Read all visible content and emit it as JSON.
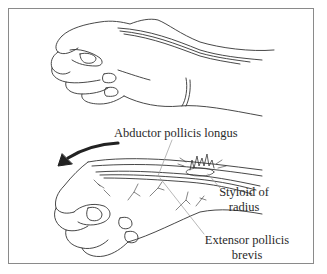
{
  "figure": {
    "labels": {
      "abductor": "Abductor pollicis longus",
      "styloid_line1": "Styloid of",
      "styloid_line2": "radius",
      "extensor_line1": "Extensor pollicis",
      "extensor_line2": "brevis"
    },
    "arrow": "curved-arrow-left",
    "colors": {
      "line": "#333333",
      "frame": "#8a8a8a",
      "leader": "#9a9a9a"
    }
  }
}
